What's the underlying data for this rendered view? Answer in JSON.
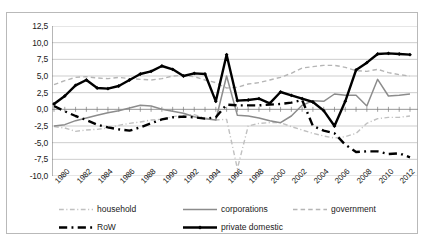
{
  "chart_data": {
    "type": "line",
    "title": "",
    "subtitle": "",
    "xlabel": "",
    "ylabel": "",
    "grid": true,
    "legend_position": "bottom",
    "ylim": [
      -10.0,
      12.5
    ],
    "ytick_values": [
      12.5,
      10.0,
      7.5,
      5.0,
      2.5,
      0.0,
      -2.5,
      -5.0,
      -7.5,
      -10.0
    ],
    "ytick_labels": [
      "12,5",
      "10,0",
      "7,5",
      "5,0",
      "2,5",
      "0,0",
      "-2,5",
      "-5,0",
      "-7,5",
      "-10,0"
    ],
    "x": [
      1980,
      1981,
      1982,
      1983,
      1984,
      1985,
      1986,
      1987,
      1988,
      1989,
      1990,
      1991,
      1992,
      1993,
      1994,
      1995,
      1996,
      1997,
      1998,
      1999,
      2000,
      2001,
      2002,
      2003,
      2004,
      2005,
      2006,
      2007,
      2008,
      2009,
      2010,
      2011,
      2012,
      2013
    ],
    "xtick_labels": [
      "1980",
      "1982",
      "1984",
      "1986",
      "1988",
      "1990",
      "1992",
      "1994",
      "1996",
      "1998",
      "2000",
      "2002",
      "2004",
      "2006",
      "2008",
      "2010",
      "2012"
    ],
    "xtick_years": [
      1980,
      1982,
      1984,
      1986,
      1988,
      1990,
      1992,
      1994,
      1996,
      1998,
      2000,
      2002,
      2004,
      2006,
      2008,
      2010,
      2012
    ],
    "series": [
      {
        "name": "household",
        "color": "#c0c0c0",
        "style": "dash-dot",
        "width": 1.4,
        "marker": "none",
        "values": [
          -2.6,
          -2.8,
          -3.3,
          -3.1,
          -3.0,
          -2.8,
          -2.4,
          -2.1,
          -1.9,
          -1.6,
          -1.5,
          -1.1,
          -0.9,
          -0.8,
          -1.3,
          -1.6,
          -1.5,
          -8.9,
          -2.5,
          -2.1,
          -2.0,
          -2.0,
          -2.6,
          -3.1,
          -3.6,
          -4.0,
          -4.3,
          -4.1,
          -3.6,
          -2.1,
          -1.4,
          -1.2,
          -1.2,
          -1.0
        ]
      },
      {
        "name": "corporations",
        "color": "#8c8c8c",
        "style": "solid",
        "width": 1.5,
        "marker": "none",
        "values": [
          -2.5,
          -2.3,
          -1.7,
          -1.3,
          -0.9,
          -0.5,
          -0.2,
          0.2,
          0.6,
          0.5,
          0.0,
          -0.3,
          -0.6,
          -1.1,
          -1.4,
          -1.6,
          5.0,
          -0.9,
          -1.0,
          -1.3,
          -1.7,
          -2.0,
          -1.0,
          0.6,
          1.3,
          1.2,
          2.3,
          2.1,
          2.1,
          0.5,
          4.5,
          2.0,
          2.1,
          2.3
        ]
      },
      {
        "name": "government",
        "color": "#b5b5b5",
        "style": "dashed",
        "width": 1.4,
        "marker": "none",
        "values": [
          3.7,
          4.3,
          4.8,
          4.9,
          4.7,
          4.6,
          4.8,
          4.6,
          4.5,
          4.4,
          4.6,
          5.0,
          5.1,
          4.9,
          4.4,
          4.0,
          3.2,
          3.3,
          3.8,
          4.0,
          4.4,
          4.8,
          5.4,
          6.2,
          6.4,
          6.6,
          6.6,
          6.3,
          5.8,
          5.7,
          6.0,
          5.5,
          5.2,
          5.0
        ]
      },
      {
        "name": "RoW",
        "color": "#000000",
        "style": "dash-dot",
        "width": 2.4,
        "marker": "none",
        "values": [
          0.5,
          -0.3,
          -1.0,
          -1.6,
          -2.3,
          -2.7,
          -3.0,
          -3.2,
          -2.7,
          -2.1,
          -1.5,
          -1.2,
          -1.1,
          -1.2,
          -1.4,
          -1.2,
          0.7,
          0.6,
          0.6,
          0.6,
          0.7,
          0.8,
          1.0,
          1.4,
          -2.5,
          -3.2,
          -3.6,
          -5.3,
          -6.4,
          -6.3,
          -6.3,
          -6.7,
          -6.6,
          -7.2
        ]
      },
      {
        "name": "private domestic",
        "color": "#000000",
        "style": "solid",
        "width": 2.4,
        "marker": "diamond",
        "values": [
          0.8,
          2.0,
          3.6,
          4.4,
          3.2,
          3.1,
          3.5,
          4.4,
          5.3,
          5.7,
          6.5,
          6.0,
          5.0,
          5.4,
          5.3,
          1.2,
          8.2,
          1.3,
          1.4,
          1.6,
          0.9,
          2.6,
          2.1,
          1.6,
          1.1,
          -0.2,
          -2.5,
          1.2,
          5.9,
          7.0,
          8.3,
          8.4,
          8.3,
          8.2
        ]
      }
    ]
  },
  "legend": {
    "items": [
      {
        "label": "household",
        "name": "legend-household"
      },
      {
        "label": "corporations",
        "name": "legend-corporations"
      },
      {
        "label": "government",
        "name": "legend-government"
      },
      {
        "label": "RoW",
        "name": "legend-row"
      },
      {
        "label": "private domestic",
        "name": "legend-private-domestic"
      }
    ]
  }
}
